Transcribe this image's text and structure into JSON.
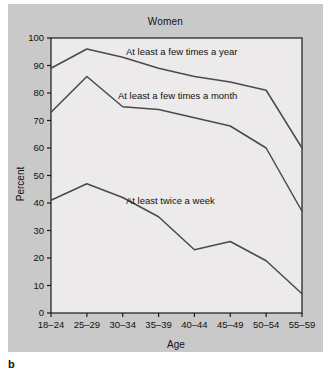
{
  "figure": {
    "panel_label": "b",
    "background_color": "#c9c9c9",
    "plot_background_color": "#eceaea",
    "line_color": "#4a4a4a",
    "axis_color": "#1a1a1a"
  },
  "chart_data": {
    "type": "line",
    "title": "Women",
    "xlabel": "Age",
    "ylabel": "Percent",
    "categories": [
      "18–24",
      "25–29",
      "30–34",
      "35–39",
      "40–44",
      "45–49",
      "50–54",
      "55–59"
    ],
    "ylim": [
      0,
      100
    ],
    "yticks": [
      0,
      10,
      20,
      30,
      40,
      50,
      60,
      70,
      80,
      90,
      100
    ],
    "grid": false,
    "legend_position": "inline-annotations",
    "series": [
      {
        "name": "At least a few times a year",
        "values": [
          89,
          96,
          93,
          89,
          86,
          84,
          81,
          60
        ]
      },
      {
        "name": "At least a few times a month",
        "values": [
          73,
          86,
          75,
          74,
          71,
          68,
          60,
          37
        ]
      },
      {
        "name": "At least twice a week",
        "values": [
          41,
          47,
          42,
          35,
          23,
          26,
          19,
          7
        ]
      }
    ],
    "annotations": [
      {
        "text": "At least a few times a year",
        "series": 0
      },
      {
        "text": "At least a few times a month",
        "series": 1
      },
      {
        "text": "At least twice a week",
        "series": 2
      }
    ]
  }
}
